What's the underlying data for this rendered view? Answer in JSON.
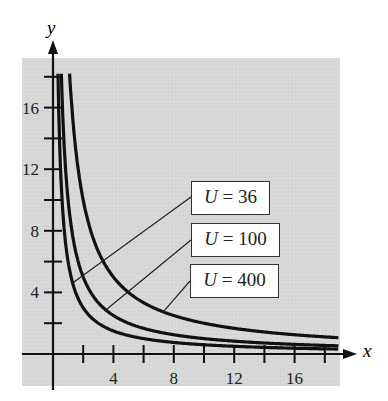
{
  "chart_data": {
    "type": "line",
    "title": "",
    "xlabel": "x",
    "ylabel": "y",
    "xlim": [
      0,
      19
    ],
    "ylim": [
      0,
      19
    ],
    "xticks": [
      4,
      8,
      12,
      16
    ],
    "yticks": [
      4,
      8,
      12,
      16
    ],
    "grid": true,
    "series": [
      {
        "name": "U = 36",
        "equation": "xy = 6",
        "label_var": "U",
        "label_value": "36"
      },
      {
        "name": "U = 100",
        "equation": "xy = 10",
        "label_var": "U",
        "label_value": "100"
      },
      {
        "name": "U = 400",
        "equation": "xy = 20",
        "label_var": "U",
        "label_value": "400"
      }
    ]
  },
  "axes": {
    "x_label": "x",
    "y_label": "y",
    "x_ticks": [
      "4",
      "8",
      "12",
      "16"
    ],
    "y_ticks": [
      "4",
      "8",
      "12",
      "16"
    ]
  },
  "labels": [
    {
      "var": "U",
      "eq": "=",
      "value": "36"
    },
    {
      "var": "U",
      "eq": "=",
      "value": "100"
    },
    {
      "var": "U",
      "eq": "=",
      "value": "400"
    }
  ],
  "colors": {
    "background": "#d9d9d9",
    "curve": "#111111",
    "label_bg": "#ffffff"
  }
}
